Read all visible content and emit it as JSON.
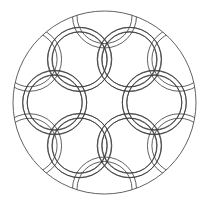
{
  "image": {
    "width": 206,
    "height": 209,
    "background": "#ffffff",
    "description": "Celtic knot mandala line-art coloring page"
  },
  "mandala": {
    "stroke_color": "#3a3a3a",
    "stroke_width": 0.8,
    "outer_circle": {
      "cx": 104.5,
      "cy": 102.5,
      "r": 91.5
    },
    "units": {
      "count": 6,
      "start_angle_deg": -90,
      "distance_from_center": 57.5,
      "triquetra_circle_offset": 29,
      "band_radii": [
        32,
        27.5
      ]
    }
  }
}
